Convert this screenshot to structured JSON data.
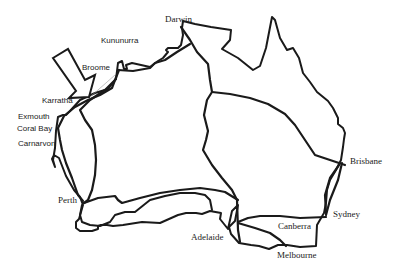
{
  "map": {
    "title": "Australia route map",
    "line_color": "#1a1a1a",
    "background": "#ffffff",
    "places": {
      "darwin": "Darwin",
      "kununurra": "Kununurra",
      "broome": "Broome",
      "karratha": "Karratha",
      "exmouth": "Exmouth",
      "coral_bay": "Coral Bay",
      "carnarvon": "Carnarvon",
      "perth": "Perth",
      "adelaide": "Adelaide",
      "melbourne": "Melbourne",
      "canberra": "Canberra",
      "sydney": "Sydney",
      "brisbane": "Brisbane"
    },
    "highlight": {
      "icon": "arrow-pointer-icon",
      "target": "Karratha"
    }
  }
}
